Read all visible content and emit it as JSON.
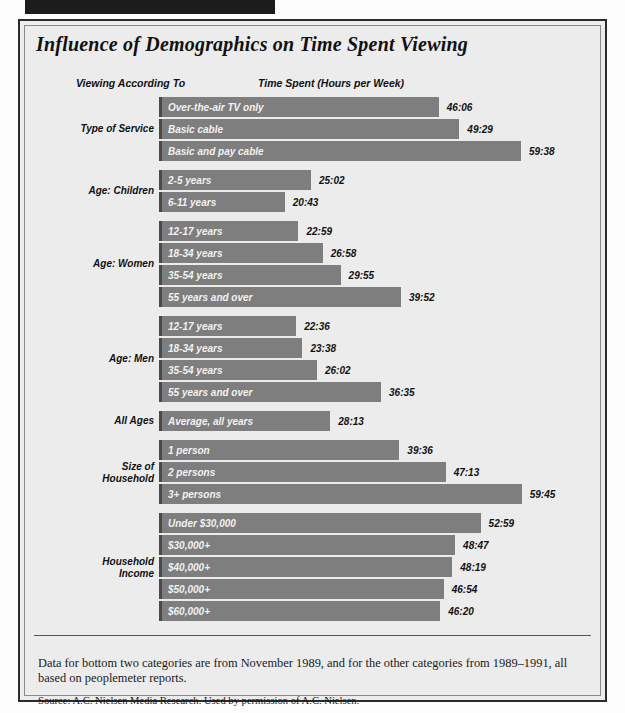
{
  "figure": {
    "title": "Influence of Demographics on Time Spent Viewing",
    "column_headers": {
      "left": "Viewing According To",
      "right": "Time Spent (Hours per Week)"
    },
    "footnote": "Data for bottom two categories are from November 1989, and for the other categories from 1989–1991, all based on peoplemeter reports.",
    "source": "Source: A.C. Nielsen Media Research. Used by permission of A.C. Nielsen.",
    "colors": {
      "bar_fill": "#7e7e7e",
      "bar_edge": "#4a4a4a",
      "panel_background": "#ececec",
      "frame": "#2b2b2b",
      "text": "#111111",
      "bar_label_text": "#f2f2f2"
    }
  },
  "chart_data": {
    "type": "bar",
    "orientation": "horizontal",
    "title": "Influence of Demographics on Time Spent Viewing",
    "xlabel": "Time Spent (Hours per Week)",
    "ylabel": "Viewing According To",
    "grid": false,
    "legend": "none",
    "value_format": "hours:minutes",
    "xlim": [
      0,
      62
    ],
    "px_per_hour": 6.07,
    "groups": [
      {
        "name": "Type of Service",
        "items": [
          {
            "label": "Over-the-air TV only",
            "value_text": "46:06",
            "value": 46.1
          },
          {
            "label": "Basic cable",
            "value_text": "49:29",
            "value": 49.48
          },
          {
            "label": "Basic and pay cable",
            "value_text": "59:38",
            "value": 59.63
          }
        ]
      },
      {
        "name": "Age: Children",
        "items": [
          {
            "label": "2-5 years",
            "value_text": "25:02",
            "value": 25.03
          },
          {
            "label": "6-11 years",
            "value_text": "20:43",
            "value": 20.72
          }
        ]
      },
      {
        "name": "Age: Women",
        "items": [
          {
            "label": "12-17 years",
            "value_text": "22:59",
            "value": 22.98
          },
          {
            "label": "18-34 years",
            "value_text": "26:58",
            "value": 26.97
          },
          {
            "label": "35-54 years",
            "value_text": "29:55",
            "value": 29.92
          },
          {
            "label": "55 years and over",
            "value_text": "39:52",
            "value": 39.87
          }
        ]
      },
      {
        "name": "Age: Men",
        "items": [
          {
            "label": "12-17 years",
            "value_text": "22:36",
            "value": 22.6
          },
          {
            "label": "18-34 years",
            "value_text": "23:38",
            "value": 23.63
          },
          {
            "label": "35-54 years",
            "value_text": "26:02",
            "value": 26.03
          },
          {
            "label": "55 years and over",
            "value_text": "36:35",
            "value": 36.58
          }
        ]
      },
      {
        "name": "All Ages",
        "items": [
          {
            "label": "Average, all years",
            "value_text": "28:13",
            "value": 28.22
          }
        ]
      },
      {
        "name": "Size of\nHousehold",
        "items": [
          {
            "label": "1 person",
            "value_text": "39:36",
            "value": 39.6
          },
          {
            "label": "2 persons",
            "value_text": "47:13",
            "value": 47.22
          },
          {
            "label": "3+ persons",
            "value_text": "59:45",
            "value": 59.75
          }
        ]
      },
      {
        "name": "Household\nIncome",
        "items": [
          {
            "label": "Under $30,000",
            "value_text": "52:59",
            "value": 52.98
          },
          {
            "label": "$30,000+",
            "value_text": "48:47",
            "value": 48.78
          },
          {
            "label": "$40,000+",
            "value_text": "48:19",
            "value": 48.32
          },
          {
            "label": "$50,000+",
            "value_text": "46:54",
            "value": 46.9
          },
          {
            "label": "$60,000+",
            "value_text": "46:20",
            "value": 46.33
          }
        ]
      }
    ]
  }
}
